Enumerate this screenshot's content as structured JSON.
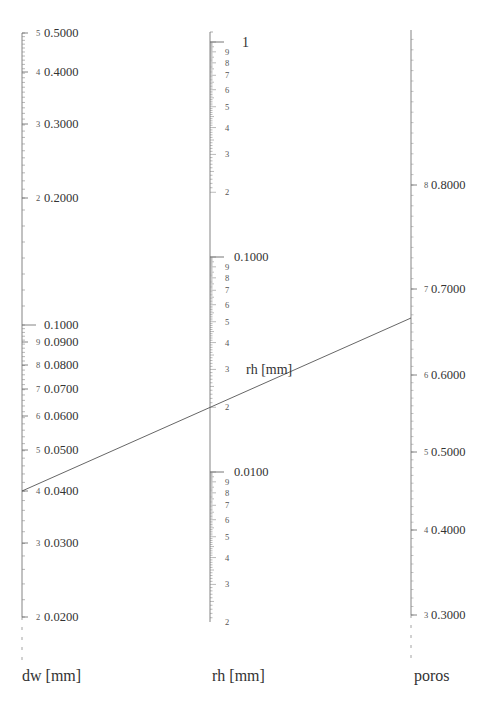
{
  "chart_data": {
    "type": "nomogram",
    "title": "",
    "axes": [
      {
        "name": "dw",
        "title": "dw [mm]",
        "scale": "log",
        "x": 22,
        "top": 33,
        "bottom": 617,
        "dashed_bottom": 665,
        "segments": [
          {
            "top_value": 0.5,
            "bottom_value": 0.2,
            "top_y": 33,
            "bottom_y": 198
          },
          {
            "top_value": 0.1,
            "bottom_value": 0.02,
            "top_y": 325,
            "bottom_y": 617
          }
        ],
        "ticks": [
          {
            "digit": "5",
            "label": "0.5000",
            "value": 0.5,
            "y": 33
          },
          {
            "digit": "4",
            "label": "0.4000",
            "value": 0.4,
            "y": 72
          },
          {
            "digit": "3",
            "label": "0.3000",
            "value": 0.3,
            "y": 124
          },
          {
            "digit": "2",
            "label": "0.2000",
            "value": 0.2,
            "y": 198
          },
          {
            "digit": "",
            "label": "0.1000",
            "value": 0.1,
            "y": 325
          },
          {
            "digit": "9",
            "label": "0.0900",
            "value": 0.09,
            "y": 342
          },
          {
            "digit": "8",
            "label": "0.0800",
            "value": 0.08,
            "y": 365
          },
          {
            "digit": "7",
            "label": "0.0700",
            "value": 0.07,
            "y": 389
          },
          {
            "digit": "6",
            "label": "0.0600",
            "value": 0.06,
            "y": 416
          },
          {
            "digit": "5",
            "label": "0.0500",
            "value": 0.05,
            "y": 450
          },
          {
            "digit": "4",
            "label": "0.0400",
            "value": 0.04,
            "y": 491
          },
          {
            "digit": "3",
            "label": "0.0300",
            "value": 0.03,
            "y": 543
          },
          {
            "digit": "2",
            "label": "0.0200",
            "value": 0.02,
            "y": 617
          }
        ]
      },
      {
        "name": "rh",
        "title": "rh [mm]",
        "scale": "log",
        "x": 210,
        "top": 32,
        "bottom": 622,
        "decades": [
          {
            "label": "1",
            "y": 42
          },
          {
            "label": "0.1000",
            "y": 257
          },
          {
            "label": "0.0100",
            "y": 472
          }
        ],
        "digit_labels": [
          "9",
          "8",
          "7",
          "6",
          "5",
          "4",
          "3",
          "2"
        ],
        "ticks_bottom_label": "2",
        "inline_label": "rh [mm]"
      },
      {
        "name": "poros",
        "title": "poros",
        "scale": "linear",
        "x": 411,
        "top": 30,
        "bottom": 615,
        "dashed_bottom": 665,
        "ticks": [
          {
            "digit": "8",
            "label": "0.8000",
            "value": 0.8,
            "y": 185
          },
          {
            "digit": "7",
            "label": "0.7000",
            "value": 0.7,
            "y": 289
          },
          {
            "digit": "6",
            "label": "0.6000",
            "value": 0.6,
            "y": 375
          },
          {
            "digit": "5",
            "label": "0.5000",
            "value": 0.5,
            "y": 452
          },
          {
            "digit": "4",
            "label": "0.4000",
            "value": 0.4,
            "y": 530
          },
          {
            "digit": "3",
            "label": "0.3000",
            "value": 0.3,
            "y": 615
          }
        ]
      }
    ],
    "isopleth": {
      "from": {
        "axis": "dw",
        "value": 0.04,
        "x": 22,
        "y": 491
      },
      "through": {
        "axis": "rh",
        "value": 0.021,
        "x": 210,
        "y": 407
      },
      "to": {
        "axis": "poros",
        "value": 0.663,
        "x": 411,
        "y": 318
      }
    }
  },
  "labels": {
    "dw_title": "dw [mm]",
    "rh_title": "rh [mm]",
    "poros_title": "poros",
    "rh_inline": "rh [mm]"
  }
}
